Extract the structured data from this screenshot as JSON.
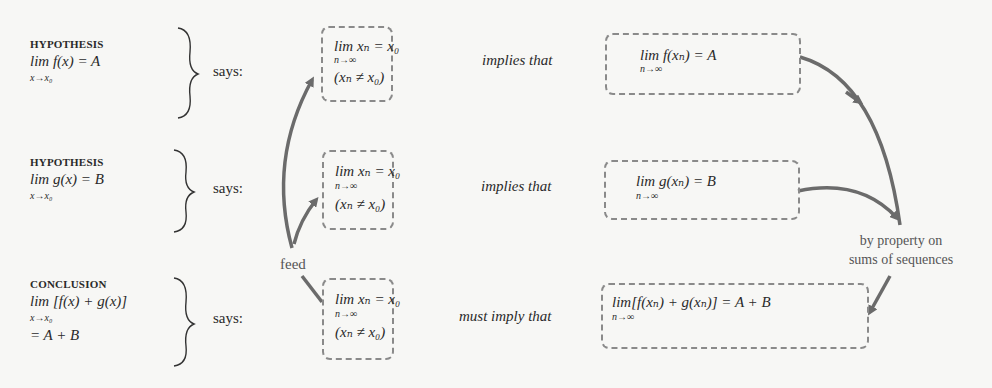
{
  "rows": [
    {
      "heading": "HYPOTHESIS",
      "statement_main": "lim f(x) = A",
      "statement_sub": "x→x₀",
      "statement_extra": "",
      "says": "says:",
      "sequence_box": {
        "line1": "lim xₙ = x₀",
        "sub": "n→∞",
        "line2": "(xₙ ≠ x₀)"
      },
      "connector": "implies that",
      "result_box": {
        "main": "lim f(xₙ) = A",
        "sub": "n→∞"
      }
    },
    {
      "heading": "HYPOTHESIS",
      "statement_main": "lim g(x) = B",
      "statement_sub": "x→x₀",
      "statement_extra": "",
      "says": "says:",
      "sequence_box": {
        "line1": "lim xₙ = x₀",
        "sub": "n→∞",
        "line2": "(xₙ ≠ x₀)"
      },
      "connector": "implies that",
      "result_box": {
        "main": "lim g(xₙ) = B",
        "sub": "n→∞"
      }
    },
    {
      "heading": "CONCLUSION",
      "statement_main": "lim [f(x) + g(x)]",
      "statement_sub": "x→x₀",
      "statement_extra": "= A + B",
      "says": "says:",
      "sequence_box": {
        "line1": "lim xₙ = x₀",
        "sub": "n→∞",
        "line2": "(xₙ ≠ x₀)"
      },
      "connector": "must imply that",
      "result_box": {
        "main": "lim[f(xₙ) + g(xₙ)] = A + B",
        "sub": "n→∞"
      }
    }
  ],
  "feed_label": "feed",
  "property_note": {
    "line1": "by property on",
    "line2": "sums of sequences"
  },
  "colors": {
    "arrow": "#6b6b6b",
    "box_border": "#8a8a8a",
    "text": "#2a2a2a"
  }
}
